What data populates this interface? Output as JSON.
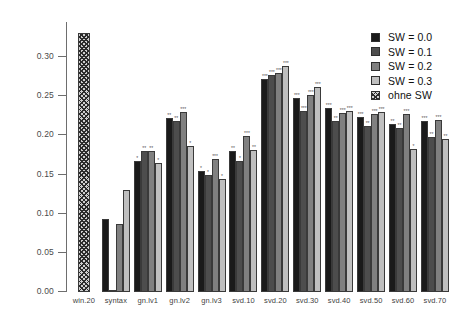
{
  "chart_data": {
    "type": "bar",
    "title": "",
    "subtitle": "",
    "xlabel": "",
    "ylabel": "",
    "ylim": [
      0.0,
      0.345
    ],
    "grid": false,
    "legend_position": "top-right",
    "categories": [
      "win.20",
      "syntax",
      "gn.lv1",
      "gn.lv2",
      "gn.lv3",
      "svd.10",
      "svd.20",
      "svd.30",
      "svd.40",
      "svd.50",
      "svd.60",
      "svd.70"
    ],
    "y_ticks": [
      0.0,
      0.05,
      0.1,
      0.15,
      0.2,
      0.25,
      0.3
    ],
    "y_tick_labels": [
      "0.00",
      "0.05",
      "0.10",
      "0.15",
      "0.20",
      "0.25",
      "0.30"
    ],
    "series": [
      {
        "name": "SW = 0.0",
        "color": "#1a1a1a",
        "values": [
          null,
          0.093,
          0.168,
          0.222,
          0.155,
          0.18,
          0.272,
          0.248,
          0.235,
          0.224,
          0.215,
          0.219
        ]
      },
      {
        "name": "SW = 0.1",
        "color": "#4d4d4d",
        "values": [
          null,
          0.003,
          0.18,
          0.219,
          0.15,
          0.168,
          0.277,
          0.231,
          0.218,
          0.212,
          0.209,
          0.198
        ]
      },
      {
        "name": "SW = 0.2",
        "color": "#808080",
        "values": [
          null,
          0.087,
          0.18,
          0.23,
          0.17,
          0.199,
          0.28,
          0.252,
          0.229,
          0.228,
          0.228,
          0.22
        ]
      },
      {
        "name": "SW = 0.3",
        "color": "#bfbfbf",
        "values": [
          null,
          0.13,
          0.165,
          0.186,
          0.145,
          0.182,
          0.289,
          0.262,
          0.231,
          0.23,
          0.183,
          0.196
        ]
      },
      {
        "name": "ohne SW",
        "color": "#cfcfcf",
        "hatched": true,
        "values": [
          0.331,
          null,
          null,
          null,
          null,
          null,
          null,
          null,
          null,
          null,
          null,
          null
        ]
      }
    ],
    "significance_markers": {
      "win.20": [
        "**",
        null,
        null,
        null,
        null
      ],
      "syntax": [
        null,
        null,
        null,
        null,
        null
      ],
      "gn.lv1": [
        "*",
        "**",
        "**",
        "*",
        null
      ],
      "gn.lv2": [
        "**",
        "**",
        "***",
        "*",
        null
      ],
      "gn.lv3": [
        "*",
        "*",
        "***",
        "*",
        null
      ],
      "svd.10": [
        "**",
        "*",
        "***",
        "**",
        null
      ],
      "svd.20": [
        "***",
        "***",
        "***",
        "***",
        null
      ],
      "svd.30": [
        "***",
        "***",
        "***",
        "***",
        null
      ],
      "svd.40": [
        "***",
        "**",
        "***",
        "***",
        null
      ],
      "svd.50": [
        "***",
        "**",
        "***",
        "***",
        null
      ],
      "svd.60": [
        "**",
        "**",
        "***",
        "*",
        null
      ],
      "svd.70": [
        "***",
        "**",
        "***",
        "**",
        null
      ]
    }
  },
  "legend": {
    "items": [
      {
        "label": "SW = 0.0",
        "swatch": "solid-dark"
      },
      {
        "label": "SW = 0.1",
        "swatch": "solid-dark-gray"
      },
      {
        "label": "SW = 0.2",
        "swatch": "solid-mid-gray"
      },
      {
        "label": "SW = 0.3",
        "swatch": "solid-light-gray"
      },
      {
        "label": "ohne SW",
        "swatch": "hatched"
      }
    ]
  }
}
